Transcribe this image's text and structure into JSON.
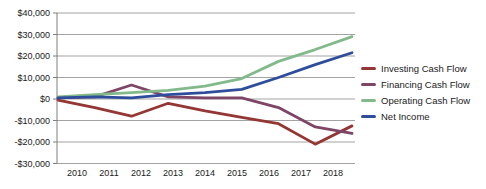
{
  "chart_data": {
    "type": "line",
    "x": [
      "2010",
      "2011",
      "2012",
      "2013",
      "2014",
      "2015",
      "2016",
      "2017",
      "2018"
    ],
    "series": [
      {
        "name": "Investing Cash Flow",
        "color": "#943634",
        "values": [
          -500,
          -4000,
          -8000,
          -2000,
          -5500,
          -8500,
          -11500,
          -21000,
          -12500
        ]
      },
      {
        "name": "Financing Cash Flow",
        "color": "#7E4566",
        "values": [
          500,
          1000,
          6500,
          1000,
          500,
          500,
          -4000,
          -13000,
          -16000
        ]
      },
      {
        "name": "Operating Cash Flow",
        "color": "#82BA8C",
        "values": [
          1000,
          2000,
          3000,
          4000,
          6000,
          9500,
          17500,
          23000,
          29000
        ]
      },
      {
        "name": "Net Income",
        "color": "#2E4E9C",
        "values": [
          500,
          1000,
          500,
          2000,
          3000,
          4500,
          10000,
          16000,
          21500
        ]
      }
    ],
    "title": "",
    "xlabel": "",
    "ylabel": "",
    "ylim": [
      -30000,
      40000
    ],
    "ytick_step": 10000,
    "ytick_labels": [
      "$40,000",
      "$30,000",
      "$20,000",
      "$10,000",
      "$0",
      "-$10,000",
      "-$20,000",
      "-$30,000"
    ],
    "grid": true,
    "legend_position": "right",
    "grid_color": "#A3A3A3",
    "axis_color": "#7F7F7F",
    "text_color": "#1a1a1a"
  }
}
